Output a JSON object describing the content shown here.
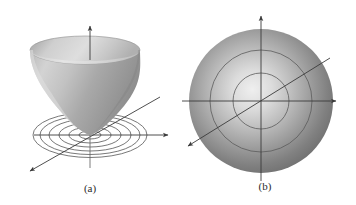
{
  "figure": {
    "background_color": "#ffffff",
    "axis_color": "#3b3b3b",
    "contour_color": "#4a4a4a",
    "surface_light": "#e2e2e2",
    "surface_mid": "#b4b4b4",
    "surface_dark": "#8d8d8d",
    "disk_light": "#eaeaea",
    "disk_dark": "#6f6f6f",
    "caption_color": "#2b2b2b"
  },
  "panels": [
    {
      "id": "panel-a",
      "caption": "(a)",
      "caption_x": 90,
      "caption_y": 192,
      "description": "Elliptic paraboloid surface opening upward with concentric elliptical level curves drawn in the xy-plane",
      "origin": {
        "x": 90,
        "y": 135
      },
      "axes": [
        {
          "name": "z-axis",
          "x1": 90,
          "y1": 168,
          "x2": 90,
          "y2": 26,
          "arrow": "end"
        },
        {
          "name": "y-axis",
          "x1": 34,
          "y1": 135,
          "x2": 168,
          "y2": 135,
          "arrow": "end"
        },
        {
          "name": "x-axis",
          "x1": 160,
          "y1": 97,
          "x2": 29,
          "y2": 172,
          "arrow": "end"
        }
      ],
      "surface": {
        "name": "elliptic-paraboloid",
        "rim_center_x": 85,
        "rim_center_y": 50,
        "rim_rx": 55,
        "rim_ry": 14,
        "apex_x": 90,
        "apex_y": 135
      },
      "level_curves": {
        "name": "concentric-level-ellipses",
        "count": 6,
        "center_x": 90,
        "center_y": 135,
        "rx": [
          11,
          21,
          31,
          41,
          50,
          57
        ],
        "ry": [
          4,
          8,
          12,
          16,
          19.5,
          22.5
        ]
      }
    },
    {
      "id": "panel-b",
      "caption": "(b)",
      "caption_x": 265,
      "caption_y": 190,
      "description": "Top view of the same surface showing a shaded disk with concentric circular level curves",
      "origin": {
        "x": 261,
        "y": 101
      },
      "axes": [
        {
          "name": "y-axis",
          "x1": 261,
          "y1": 181,
          "x2": 261,
          "y2": 14,
          "arrow": "end"
        },
        {
          "name": "x-axis",
          "x1": 182,
          "y1": 101,
          "x2": 336,
          "y2": 101,
          "arrow": "end"
        },
        {
          "name": "x-axis-oblique",
          "x1": 330,
          "y1": 58,
          "x2": 187,
          "y2": 147,
          "arrow": "end"
        }
      ],
      "disk": {
        "name": "shaded-disk",
        "center_x": 261,
        "center_y": 101,
        "radius": 72,
        "highlight_x": 252,
        "highlight_y": 95
      },
      "level_curves": {
        "name": "concentric-level-circles",
        "count": 2,
        "center_x": 261,
        "center_y": 101,
        "radii": [
          28,
          51
        ]
      }
    }
  ]
}
